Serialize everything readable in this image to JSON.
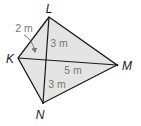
{
  "diagram": {
    "type": "kite",
    "colors": {
      "fill": "#e4e4e4",
      "stroke": "#1a1a1a",
      "measure_text": "#777777",
      "vertex_text": "#1a1a1a"
    },
    "vertices": [
      {
        "id": "L",
        "label": "L",
        "x": 49,
        "y": 17,
        "label_x": 49,
        "label_y": 13
      },
      {
        "id": "K",
        "label": "K",
        "x": 18,
        "y": 58,
        "label_x": 10,
        "label_y": 63
      },
      {
        "id": "M",
        "label": "M",
        "x": 117,
        "y": 65,
        "label_x": 127,
        "label_y": 70
      },
      {
        "id": "N",
        "label": "N",
        "x": 43,
        "y": 103,
        "label_x": 40,
        "label_y": 119
      }
    ],
    "diagonals": [
      {
        "from": "L",
        "to": "N"
      },
      {
        "from": "K",
        "to": "M"
      }
    ],
    "measurements": [
      {
        "id": "m-2",
        "text": "2 m",
        "x": 24,
        "y": 32,
        "note": "segment from K to diagonal intersection, indicated by arrow"
      },
      {
        "id": "m-3-top",
        "text": "3 m",
        "x": 59,
        "y": 47
      },
      {
        "id": "m-5",
        "text": "5 m",
        "x": 73,
        "y": 74
      },
      {
        "id": "m-3-bottom",
        "text": "3 m",
        "x": 57,
        "y": 88
      }
    ]
  }
}
